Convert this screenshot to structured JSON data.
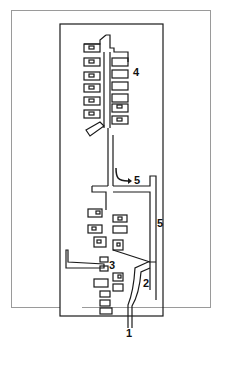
{
  "figure": {
    "type": "architectural floor plan / schematic",
    "colors": {
      "line": "#1a1a1a",
      "frame": "#9a9a9a",
      "background": "#ffffff"
    }
  },
  "labels": [
    {
      "id": "label-1",
      "text": "1"
    },
    {
      "id": "label-2",
      "text": "2"
    },
    {
      "id": "label-3",
      "text": "3"
    },
    {
      "id": "label-4",
      "text": "4"
    },
    {
      "id": "label-5a",
      "text": "5"
    },
    {
      "id": "label-5b",
      "text": "5"
    }
  ]
}
